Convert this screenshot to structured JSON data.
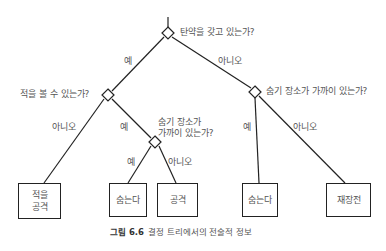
{
  "diagram": {
    "root": {
      "question": "탄약을 갖고 있는가?"
    },
    "edges": {
      "root_yes": "예",
      "root_no": "아니오",
      "see_enemy_no": "아니오",
      "see_enemy_yes": "예",
      "hide_left_yes": "예",
      "hide_left_no": "아니오",
      "hide_right_yes": "예",
      "hide_right_no": "아니오"
    },
    "nodes": {
      "see_enemy": "적을 볼 수 있는가?",
      "hide_near_left_line1": "숨기 장소가",
      "hide_near_left_line2": "가까이 있는가?",
      "hide_near_right": "숨기 장소가 가까이 있는가?"
    },
    "leaves": {
      "attack_enemy_line1": "적을",
      "attack_enemy_line2": "공격",
      "hide_left": "숨는다",
      "attack": "공격",
      "hide_right": "숨는다",
      "reload": "재장전"
    }
  },
  "caption": {
    "figure_label": "그림 6.6",
    "text": "결정 트리에서의 전술적 정보"
  }
}
